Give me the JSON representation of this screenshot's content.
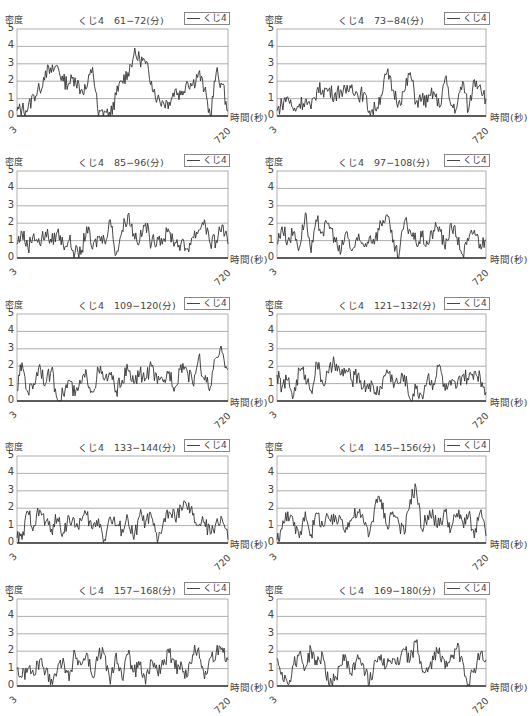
{
  "common": {
    "ylabel": "密度",
    "xlabel": "時間(秒)",
    "legend": "くじ4",
    "yticks": [
      "0",
      "1",
      "2",
      "3",
      "4",
      "5"
    ],
    "xticks": [
      "3",
      "720"
    ],
    "line_color": "#333333",
    "grid_color": "#999999"
  },
  "panels": [
    {
      "title": "くじ4　61−72(分)"
    },
    {
      "title": "くじ4　73−84(分)"
    },
    {
      "title": "くじ4　85−96(分)"
    },
    {
      "title": "くじ4　97−108(分)"
    },
    {
      "title": "くじ4　109−120(分)"
    },
    {
      "title": "くじ4　121−132(分)"
    },
    {
      "title": "くじ4　133−144(分)"
    },
    {
      "title": "くじ4　145−156(分)"
    },
    {
      "title": "くじ4　157−168(分)"
    },
    {
      "title": "くじ4　169−180(分)"
    }
  ],
  "chart_data": [
    {
      "type": "line",
      "title": "くじ4　61−72(分)",
      "xlabel": "時間(秒)",
      "ylabel": "密度",
      "ylim": [
        0,
        5
      ],
      "xlim": [
        3,
        720
      ],
      "grid": true,
      "legend": [
        "くじ4"
      ],
      "legend_position": "top-right",
      "x": [
        3,
        20,
        40,
        60,
        80,
        100,
        120,
        140,
        160,
        180,
        200,
        220,
        240,
        260,
        280,
        300,
        320,
        340,
        360,
        380,
        400,
        420,
        440,
        460,
        480,
        500,
        520,
        540,
        560,
        580,
        600,
        620,
        640,
        660,
        680,
        700,
        720
      ],
      "series": [
        {
          "name": "くじ4",
          "values": [
            0.3,
            0.4,
            0.4,
            1.2,
            1.5,
            2.6,
            2.5,
            2.9,
            2.0,
            1.9,
            2.2,
            1.5,
            1.6,
            2.8,
            0,
            0.3,
            0,
            1.2,
            2.0,
            2.5,
            3.5,
            3.3,
            3.0,
            2.0,
            1.0,
            0.8,
            0.8,
            1.5,
            1.2,
            2.0,
            1.8,
            2.5,
            1.5,
            0,
            2.5,
            1.8,
            0.3
          ]
        }
      ]
    },
    {
      "type": "line",
      "title": "くじ4　73−84(分)",
      "xlabel": "時間(秒)",
      "ylabel": "密度",
      "ylim": [
        0,
        5
      ],
      "xlim": [
        3,
        720
      ],
      "grid": true,
      "legend": [
        "くじ4"
      ],
      "legend_position": "top-right",
      "x": [
        3,
        20,
        40,
        60,
        80,
        100,
        120,
        140,
        160,
        180,
        200,
        220,
        240,
        260,
        280,
        300,
        320,
        340,
        360,
        380,
        400,
        420,
        440,
        460,
        480,
        500,
        520,
        540,
        560,
        580,
        600,
        620,
        640,
        660,
        680,
        700,
        720
      ],
      "series": [
        {
          "name": "くじ4",
          "values": [
            0.3,
            0.7,
            1.1,
            0.3,
            0.7,
            0.9,
            0.4,
            1.5,
            1.5,
            1.5,
            1.2,
            1.5,
            1.3,
            1.8,
            1.2,
            1.3,
            0.3,
            0.4,
            1.2,
            2.5,
            1.5,
            0.8,
            1.4,
            2.5,
            0.8,
            1.0,
            0.8,
            1.4,
            0.5,
            2.2,
            0.6,
            0.5,
            2.0,
            0.3,
            2.1,
            1.8,
            1.0
          ]
        }
      ]
    },
    {
      "type": "line",
      "title": "くじ4　85−96(分)",
      "xlabel": "時間(秒)",
      "ylabel": "密度",
      "ylim": [
        0,
        5
      ],
      "xlim": [
        3,
        720
      ],
      "grid": true,
      "legend": [
        "くじ4"
      ],
      "legend_position": "top-right",
      "x": [
        3,
        20,
        40,
        60,
        80,
        100,
        120,
        140,
        160,
        180,
        200,
        220,
        240,
        260,
        280,
        300,
        320,
        340,
        360,
        380,
        400,
        420,
        440,
        460,
        480,
        500,
        520,
        540,
        560,
        580,
        600,
        620,
        640,
        660,
        680,
        700,
        720
      ],
      "series": [
        {
          "name": "くじ4",
          "values": [
            0.8,
            1.5,
            0.6,
            1.4,
            0.8,
            1.5,
            0.9,
            1.5,
            0.8,
            1.0,
            0.3,
            0.2,
            1.8,
            0.5,
            1.2,
            1.0,
            2.2,
            0.2,
            1.6,
            2.5,
            1.4,
            1.0,
            2.0,
            0.8,
            1.2,
            1.1,
            1.5,
            0.9,
            0.8,
            0.5,
            1.2,
            1.6,
            2.2,
            0.8,
            1.0,
            1.9,
            0.8
          ]
        }
      ]
    },
    {
      "type": "line",
      "title": "くじ4　97−108(分)",
      "xlabel": "時間(秒)",
      "ylabel": "密度",
      "ylim": [
        0,
        5
      ],
      "xlim": [
        3,
        720
      ],
      "grid": true,
      "legend": [
        "くじ4"
      ],
      "legend_position": "top-right",
      "x": [
        3,
        20,
        40,
        60,
        80,
        100,
        120,
        140,
        160,
        180,
        200,
        220,
        240,
        260,
        280,
        300,
        320,
        340,
        360,
        380,
        400,
        420,
        440,
        460,
        480,
        500,
        520,
        540,
        560,
        580,
        600,
        620,
        640,
        660,
        680,
        700,
        720
      ],
      "series": [
        {
          "name": "くじ4",
          "values": [
            0.8,
            1.8,
            1.0,
            1.5,
            0.6,
            2.6,
            0.3,
            2.1,
            1.5,
            2.0,
            1.2,
            0.2,
            1.5,
            0.4,
            1.0,
            0.7,
            1.2,
            1.1,
            2.0,
            2.5,
            0.9,
            0,
            2.1,
            1.6,
            0.9,
            1.2,
            0.8,
            1.6,
            1.8,
            0.5,
            2.0,
            1.2,
            0.2,
            1.0,
            1.6,
            0.8,
            1.0
          ]
        }
      ]
    },
    {
      "type": "line",
      "title": "くじ4　109−120(分)",
      "xlabel": "時間(秒)",
      "ylabel": "密度",
      "ylim": [
        0,
        5
      ],
      "xlim": [
        3,
        720
      ],
      "grid": true,
      "legend": [
        "くじ4"
      ],
      "legend_position": "top-right",
      "x": [
        3,
        20,
        40,
        60,
        80,
        100,
        120,
        140,
        160,
        180,
        200,
        220,
        240,
        260,
        280,
        300,
        320,
        340,
        360,
        380,
        400,
        420,
        440,
        460,
        480,
        500,
        520,
        540,
        560,
        580,
        600,
        620,
        640,
        660,
        680,
        700,
        720
      ],
      "series": [
        {
          "name": "くじ4",
          "values": [
            0.6,
            2.2,
            0.5,
            1.0,
            2.1,
            1.0,
            1.8,
            0.1,
            0.4,
            1.2,
            0.3,
            1.0,
            1.5,
            0.5,
            1.8,
            1.2,
            1.5,
            0.6,
            1.2,
            1.8,
            1.0,
            1.6,
            1.3,
            2.0,
            1.0,
            1.1,
            1.7,
            0.8,
            2.1,
            1.8,
            1.0,
            2.5,
            1.2,
            0.8,
            2.5,
            2.8,
            1.8
          ]
        }
      ]
    },
    {
      "type": "line",
      "title": "くじ4　121−132(分)",
      "xlabel": "時間(秒)",
      "ylabel": "密度",
      "ylim": [
        0,
        5
      ],
      "xlim": [
        3,
        720
      ],
      "grid": true,
      "legend": [
        "くじ4"
      ],
      "legend_position": "top-right",
      "x": [
        3,
        20,
        40,
        60,
        80,
        100,
        120,
        140,
        160,
        180,
        200,
        220,
        240,
        260,
        280,
        300,
        320,
        340,
        360,
        380,
        400,
        420,
        440,
        460,
        480,
        500,
        520,
        540,
        560,
        580,
        600,
        620,
        640,
        660,
        680,
        700,
        720
      ],
      "series": [
        {
          "name": "くじ4",
          "values": [
            1.5,
            0.8,
            1.2,
            0.3,
            1.8,
            1.5,
            0.6,
            2.2,
            1.0,
            1.6,
            2.2,
            1.5,
            1.8,
            1.2,
            1.5,
            0.8,
            1.0,
            0.5,
            0.8,
            1.8,
            1.2,
            1.0,
            1.5,
            0.1,
            0.7,
            0.3,
            1.4,
            1.0,
            2.1,
            0.6,
            0.9,
            0.8,
            1.5,
            1.2,
            1.7,
            1.4,
            0.5
          ]
        }
      ]
    },
    {
      "type": "line",
      "title": "くじ4　133−144(分)",
      "xlabel": "時間(秒)",
      "ylabel": "密度",
      "ylim": [
        0,
        5
      ],
      "xlim": [
        3,
        720
      ],
      "grid": true,
      "legend": [
        "くじ4"
      ],
      "legend_position": "top-right",
      "x": [
        3,
        20,
        40,
        60,
        80,
        100,
        120,
        140,
        160,
        180,
        200,
        220,
        240,
        260,
        280,
        300,
        320,
        340,
        360,
        380,
        400,
        420,
        440,
        460,
        480,
        500,
        520,
        540,
        560,
        580,
        600,
        620,
        640,
        660,
        680,
        700,
        720
      ],
      "series": [
        {
          "name": "くじ4",
          "values": [
            0.3,
            0.2,
            1.8,
            1.0,
            1.9,
            1.2,
            0.8,
            1.4,
            0.6,
            1.5,
            0.9,
            1.3,
            1.6,
            0.8,
            1.4,
            0.2,
            1.5,
            1.0,
            0.8,
            1.4,
            0.2,
            1.6,
            1.2,
            1.5,
            0,
            1.2,
            1.8,
            1.4,
            2.1,
            2.1,
            1.6,
            1.0,
            1.2,
            0.5,
            1.2,
            1.4,
            0.2
          ]
        }
      ]
    },
    {
      "type": "line",
      "title": "くじ4　145−156(分)",
      "xlabel": "時間(秒)",
      "ylabel": "密度",
      "ylim": [
        0,
        5
      ],
      "xlim": [
        3,
        720
      ],
      "grid": true,
      "legend": [
        "くじ4"
      ],
      "legend_position": "top-right",
      "x": [
        3,
        20,
        40,
        60,
        80,
        100,
        120,
        140,
        160,
        180,
        200,
        220,
        240,
        260,
        280,
        300,
        320,
        340,
        360,
        380,
        400,
        420,
        440,
        460,
        480,
        500,
        520,
        540,
        560,
        580,
        600,
        620,
        640,
        660,
        680,
        700,
        720
      ],
      "series": [
        {
          "name": "くじ4",
          "values": [
            0.2,
            0.8,
            1.8,
            1.0,
            0.3,
            1.8,
            0.5,
            1.7,
            1.0,
            1.4,
            1.2,
            1.5,
            0.9,
            1.4,
            1.8,
            1.2,
            0.5,
            2.2,
            2.5,
            1.0,
            1.8,
            1.2,
            0.5,
            2.5,
            3.2,
            0.8,
            1.6,
            1.5,
            1.0,
            1.8,
            0.8,
            1.7,
            1.2,
            1.6,
            0.3,
            1.8,
            0.4
          ]
        }
      ]
    },
    {
      "type": "line",
      "title": "くじ4　157−168(分)",
      "xlabel": "時間(秒)",
      "ylabel": "密度",
      "ylim": [
        0,
        5
      ],
      "xlim": [
        3,
        720
      ],
      "grid": true,
      "legend": [
        "くじ4"
      ],
      "legend_position": "top-right",
      "x": [
        3,
        20,
        40,
        60,
        80,
        100,
        120,
        140,
        160,
        180,
        200,
        220,
        240,
        260,
        280,
        300,
        320,
        340,
        360,
        380,
        400,
        420,
        440,
        460,
        480,
        500,
        520,
        540,
        560,
        580,
        600,
        620,
        640,
        660,
        680,
        700,
        720
      ],
      "series": [
        {
          "name": "くじ4",
          "values": [
            1.0,
            0.5,
            1.0,
            0.6,
            1.5,
            0.8,
            0.4,
            0.9,
            1.6,
            0.3,
            1.9,
            1.2,
            1.9,
            0.5,
            1.8,
            1.8,
            0.1,
            1.9,
            0.4,
            1.8,
            0.8,
            1.2,
            0.1,
            1.5,
            0.8,
            1.2,
            1.9,
            1.0,
            1.4,
            0.5,
            1.8,
            2.2,
            0.4,
            1.6,
            1.9,
            2.2,
            1.5
          ]
        }
      ]
    },
    {
      "type": "line",
      "title": "くじ4　169−180(分)",
      "xlabel": "時間(秒)",
      "ylabel": "密度",
      "ylim": [
        0,
        5
      ],
      "xlim": [
        3,
        720
      ],
      "grid": true,
      "legend": [
        "くじ4"
      ],
      "legend_position": "top-right",
      "x": [
        3,
        20,
        40,
        60,
        80,
        100,
        120,
        140,
        160,
        180,
        200,
        220,
        240,
        260,
        280,
        300,
        320,
        340,
        360,
        380,
        400,
        420,
        440,
        460,
        480,
        500,
        520,
        540,
        560,
        580,
        600,
        620,
        640,
        660,
        680,
        700,
        720
      ],
      "series": [
        {
          "name": "くじ4",
          "values": [
            1.6,
            0.8,
            0.1,
            1.2,
            1.9,
            1.0,
            2.1,
            1.2,
            1.8,
            0.1,
            0.3,
            1.2,
            1.6,
            0.6,
            1.8,
            1.2,
            0.1,
            1.5,
            1.8,
            1.2,
            1.6,
            1.2,
            2.1,
            1.5,
            2.5,
            1.0,
            0.8,
            1.5,
            2.2,
            1.0,
            1.8,
            2.2,
            1.4,
            0.1,
            1.0,
            1.8,
            1.5
          ]
        }
      ]
    }
  ]
}
